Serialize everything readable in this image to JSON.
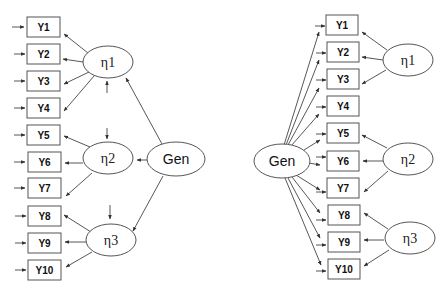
{
  "left_model": {
    "indicators": [
      "Y1",
      "Y2",
      "Y3",
      "Y4",
      "Y5",
      "Y6",
      "Y7",
      "Y8",
      "Y9",
      "Y10"
    ],
    "factors": [
      {
        "label": "η1",
        "loads_on": [
          "Y1",
          "Y2",
          "Y3",
          "Y4"
        ]
      },
      {
        "label": "η2",
        "loads_on": [
          "Y5",
          "Y6",
          "Y7"
        ]
      },
      {
        "label": "η3",
        "loads_on": [
          "Y8",
          "Y9",
          "Y10"
        ]
      }
    ],
    "general": {
      "label": "Gen",
      "points_to": [
        "η1",
        "η2",
        "η3"
      ]
    }
  },
  "right_model": {
    "indicators": [
      "Y1",
      "Y2",
      "Y3",
      "Y4",
      "Y5",
      "Y6",
      "Y7",
      "Y8",
      "Y9",
      "Y10"
    ],
    "factors": [
      {
        "label": "η1",
        "loads_on": [
          "Y1",
          "Y2",
          "Y3"
        ]
      },
      {
        "label": "η2",
        "loads_on": [
          "Y5",
          "Y6",
          "Y7"
        ]
      },
      {
        "label": "η3",
        "loads_on": [
          "Y8",
          "Y9",
          "Y10"
        ]
      }
    ],
    "general": {
      "label": "Gen",
      "points_to": [
        "Y1",
        "Y2",
        "Y3",
        "Y4",
        "Y5",
        "Y6",
        "Y7",
        "Y8",
        "Y9",
        "Y10"
      ]
    }
  },
  "colors": {
    "stroke": "#555555",
    "text": "#111111",
    "background": "#ffffff"
  }
}
